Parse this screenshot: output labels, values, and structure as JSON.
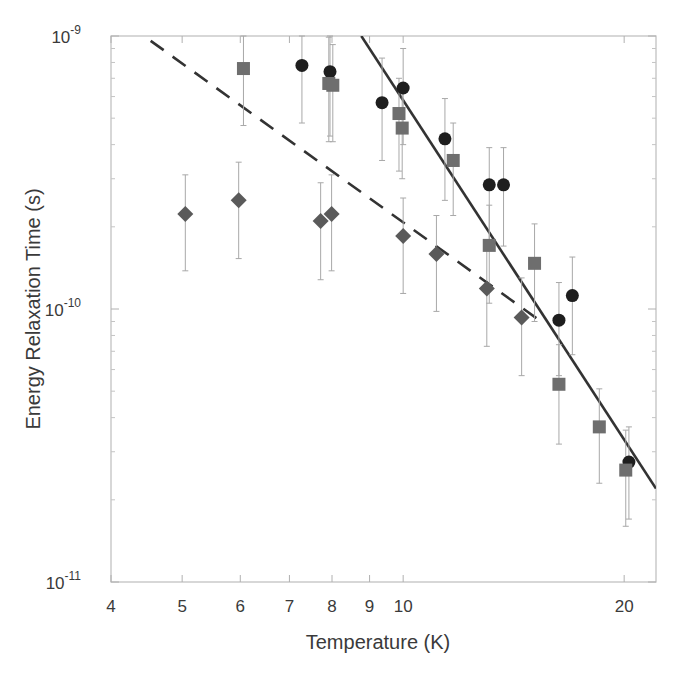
{
  "chart_data": {
    "type": "scatter",
    "title": "",
    "xlabel": "Temperature (K)",
    "ylabel": "Energy Relaxation Time (s)",
    "xscale": "log",
    "yscale": "log",
    "xlim": [
      4,
      22.1
    ],
    "ylim": [
      1e-11,
      1e-09
    ],
    "x_ticks": [
      4,
      5,
      6,
      7,
      8,
      9,
      10,
      20
    ],
    "x_tick_labels": [
      "4",
      "5",
      "6",
      "7",
      "8",
      "9",
      "10",
      "20"
    ],
    "y_ticks": [
      1e-11,
      1e-10,
      1e-09
    ],
    "y_tick_labels": [
      {
        "base": "10",
        "exp": "-11"
      },
      {
        "base": "10",
        "exp": "-10"
      },
      {
        "base": "10",
        "exp": "-9"
      }
    ],
    "grid": false,
    "legend": null,
    "series": [
      {
        "name": "circles",
        "marker": "circle",
        "color": "#1e1e1e",
        "points": [
          {
            "x": 7.28,
            "y": 7.8e-10,
            "lo": 4.8e-10,
            "hi": 1e-09
          },
          {
            "x": 7.95,
            "y": 7.4e-10,
            "lo": 4.3e-10,
            "hi": 1e-09
          },
          {
            "x": 9.36,
            "y": 5.7e-10,
            "lo": 3.5e-10,
            "hi": 8.3e-10
          },
          {
            "x": 10.0,
            "y": 6.45e-10,
            "lo": 4e-10,
            "hi": 9e-10
          },
          {
            "x": 11.4,
            "y": 4.2e-10,
            "lo": 2.5e-10,
            "hi": 5.9e-10
          },
          {
            "x": 13.1,
            "y": 2.85e-10,
            "lo": 1.7e-10,
            "hi": 3.9e-10
          },
          {
            "x": 13.7,
            "y": 2.85e-10,
            "lo": 1.7e-10,
            "hi": 3.9e-10
          },
          {
            "x": 16.3,
            "y": 9.1e-11,
            "lo": 5.7e-11,
            "hi": 1.25e-10
          },
          {
            "x": 17.0,
            "y": 1.12e-10,
            "lo": 6.8e-11,
            "hi": 1.55e-10
          },
          {
            "x": 20.3,
            "y": 2.75e-11,
            "lo": 1.7e-11,
            "hi": 3.7e-11
          }
        ]
      },
      {
        "name": "squares",
        "marker": "square",
        "color": "#6e6e6e",
        "points": [
          {
            "x": 6.06,
            "y": 7.6e-10,
            "lo": 4.7e-10,
            "hi": 1e-09
          },
          {
            "x": 7.92,
            "y": 6.7e-10,
            "lo": 4.1e-10,
            "hi": 9.9e-10
          },
          {
            "x": 8.02,
            "y": 6.6e-10,
            "lo": 4.1e-10,
            "hi": 9.3e-10
          },
          {
            "x": 9.87,
            "y": 5.2e-10,
            "lo": 3.2e-10,
            "hi": 7e-10
          },
          {
            "x": 9.97,
            "y": 4.6e-10,
            "lo": 3e-10,
            "hi": 6.3e-10
          },
          {
            "x": 11.7,
            "y": 3.5e-10,
            "lo": 2.2e-10,
            "hi": 4.8e-10
          },
          {
            "x": 13.1,
            "y": 1.71e-10,
            "lo": 1.05e-10,
            "hi": 2.4e-10
          },
          {
            "x": 15.1,
            "y": 1.47e-10,
            "lo": 9e-11,
            "hi": 2.05e-10
          },
          {
            "x": 16.3,
            "y": 5.3e-11,
            "lo": 3.2e-11,
            "hi": 7.4e-11
          },
          {
            "x": 18.5,
            "y": 3.7e-11,
            "lo": 2.3e-11,
            "hi": 5.1e-11
          },
          {
            "x": 20.1,
            "y": 2.57e-11,
            "lo": 1.6e-11,
            "hi": 3.6e-11
          }
        ]
      },
      {
        "name": "diamonds",
        "marker": "diamond",
        "color": "#5a5a5a",
        "points": [
          {
            "x": 5.05,
            "y": 2.23e-10,
            "lo": 1.38e-10,
            "hi": 3.1e-10
          },
          {
            "x": 5.97,
            "y": 2.5e-10,
            "lo": 1.53e-10,
            "hi": 3.45e-10
          },
          {
            "x": 7.72,
            "y": 2.1e-10,
            "lo": 1.28e-10,
            "hi": 2.9e-10
          },
          {
            "x": 7.99,
            "y": 2.23e-10,
            "lo": 1.38e-10,
            "hi": 3.1e-10
          },
          {
            "x": 10.0,
            "y": 1.85e-10,
            "lo": 1.14e-10,
            "hi": 2.55e-10
          },
          {
            "x": 11.1,
            "y": 1.59e-10,
            "lo": 9.8e-11,
            "hi": 2.2e-10
          },
          {
            "x": 13.0,
            "y": 1.19e-10,
            "lo": 7.3e-11,
            "hi": 1.65e-10
          },
          {
            "x": 14.5,
            "y": 9.3e-11,
            "lo": 5.7e-11,
            "hi": 1.3e-10
          }
        ]
      }
    ],
    "fit_lines": [
      {
        "name": "dashed-fit",
        "style": "dashed",
        "color": "#333333",
        "from": {
          "x": 4.53,
          "y": 9.6e-10
        },
        "to": {
          "x": 15.5,
          "y": 8.9e-11
        }
      },
      {
        "name": "solid-fit",
        "style": "solid",
        "color": "#333333",
        "from": {
          "x": 8.77,
          "y": 1e-09
        },
        "to": {
          "x": 22.1,
          "y": 2.2e-11
        }
      }
    ],
    "plot_area_px": {
      "left": 111,
      "right": 656,
      "top": 36,
      "bottom": 582
    }
  }
}
